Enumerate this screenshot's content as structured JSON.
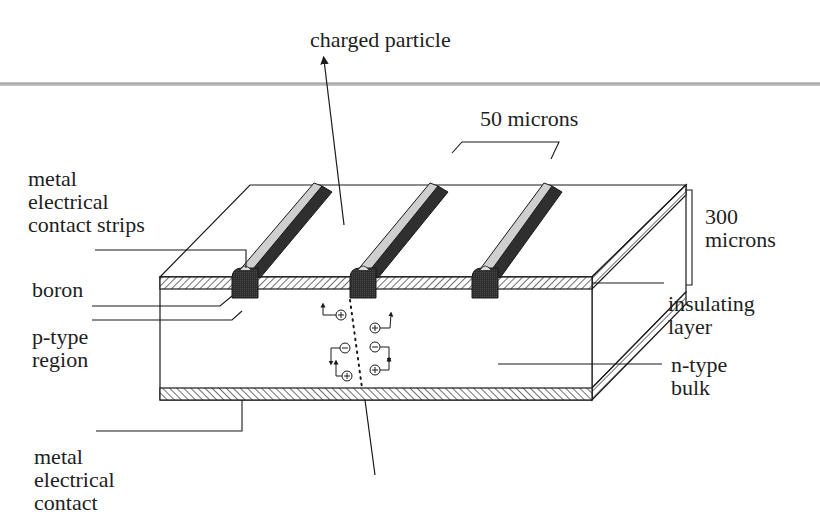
{
  "figure": {
    "labels": {
      "charged_particle": "charged particle",
      "strip_pitch": "50 microns",
      "thickness_line1": "300",
      "thickness_line2": "microns",
      "metal_strips_line1": "metal",
      "metal_strips_line2": "electrical",
      "metal_strips_line3": "contact strips",
      "boron": "boron",
      "p_type_line1": "p-type",
      "p_type_line2": "region",
      "insulating_line1": "insulating",
      "insulating_line2": "layer",
      "n_type_line1": "n-type",
      "n_type_line2": "bulk",
      "back_contact_line1": "metal",
      "back_contact_line2": "electrical",
      "back_contact_line3": "contact"
    },
    "charges": {
      "left_column": [
        "+",
        "-",
        "+"
      ],
      "right_column": [
        "+",
        "-",
        "+"
      ]
    },
    "strip_count": 3,
    "colors": {
      "line": "#1a1a1a",
      "separator": "#b8b8b8",
      "strip_light": "#cfcfcf",
      "strip_dark": "#3a3a3a",
      "pad": "#2b2b2b"
    }
  }
}
